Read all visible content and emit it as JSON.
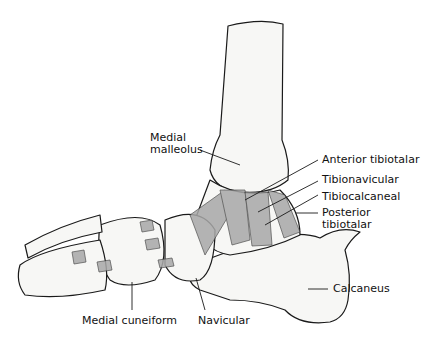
{
  "figure": {
    "labels": {
      "medial_malleolus_l1": "Medial",
      "medial_malleolus_l2": "malleolus",
      "anterior_tibiotalar": "Anterior tibiotalar",
      "tibionavicular": "Tibionavicular",
      "tibiocalcaneal": "Tibiocalcaneal",
      "posterior_tibiotalar_l1": "Posterior",
      "posterior_tibiotalar_l2": "tibiotalar",
      "calcaneus": "Calcaneus",
      "medial_cuneiform": "Medial cuneiform",
      "navicular": "Navicular"
    },
    "colors": {
      "background": "#ffffff",
      "line": "#1a1a1a",
      "bone_fill": "#f7f7f5",
      "ligament_fill": "#9a9a9a"
    }
  }
}
